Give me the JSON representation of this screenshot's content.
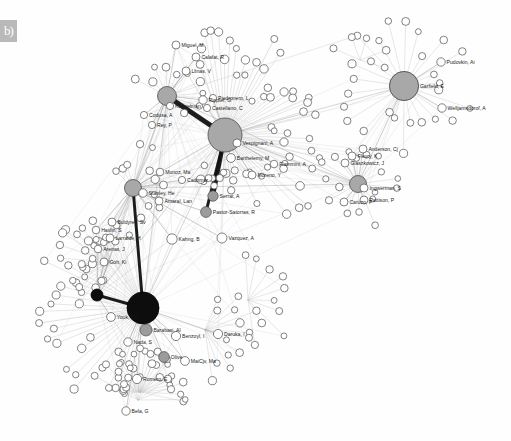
{
  "figure": {
    "panel_tag": "b)",
    "background_color": "#fefefe",
    "width": 511,
    "height": 441,
    "title": ""
  },
  "style": {
    "hub_black": "#0d0d0d",
    "hub_gray": "#a8a8a8",
    "node_mid_gray": "#9b9b9b",
    "node_white": "#ffffff",
    "node_stroke": "#4d4d4d",
    "edge_light": "#bfbfbf",
    "edge_mid": "#8a8a8a",
    "edge_dark": "#111111",
    "label_color": "#1a1a1a"
  },
  "chart_data": {
    "type": "scatter",
    "title": "",
    "xlabel": "",
    "ylabel": "",
    "layout": "force-directed network, no axes, no grid, no legend",
    "clusters": [
      {
        "name": "network-science-cluster",
        "hub": "Barabasi, AL",
        "position": "left-center"
      },
      {
        "name": "webometrics-cluster",
        "hub": "unlabeled-gray-hub",
        "position": "top-center"
      },
      {
        "name": "garfield-cluster",
        "hub": "Garfield, E",
        "position": "top-right"
      },
      {
        "name": "informetrics-cluster",
        "hub": "unlabeled-gray-hub-2",
        "position": "right-center"
      }
    ],
    "labeled_nodes": [
      {
        "label": "Miguel, M",
        "x": 176,
        "y": 45,
        "r": 4.0,
        "fill": "#ffffff"
      },
      {
        "label": "Calafat, R",
        "x": 196,
        "y": 57,
        "r": 4.0,
        "fill": "#ffffff"
      },
      {
        "label": "Llinas, V",
        "x": 186,
        "y": 71,
        "r": 4.0,
        "fill": "#ffffff"
      },
      {
        "label": "Kappelman",
        "x": 170,
        "y": 106,
        "r": 3.6,
        "fill": "#ffffff"
      },
      {
        "label": "Codusa, A",
        "x": 144,
        "y": 115,
        "r": 3.6,
        "fill": "#ffffff"
      },
      {
        "label": "Rey, P",
        "x": 152,
        "y": 125,
        "r": 3.6,
        "fill": "#ffffff"
      },
      {
        "label": "Rippler, G",
        "x": 203,
        "y": 100,
        "r": 4.2,
        "fill": "#ffffff"
      },
      {
        "label": "Piedronero, L",
        "x": 213,
        "y": 98,
        "r": 3.6,
        "fill": "#ffffff"
      },
      {
        "label": "Castellano, C",
        "x": 207,
        "y": 108,
        "r": 3.6,
        "fill": "#ffffff"
      },
      {
        "label": "Vespignani, A",
        "x": 237,
        "y": 143,
        "r": 4.0,
        "fill": "#ffffff"
      },
      {
        "label": "Barthelemy, M",
        "x": 231,
        "y": 158,
        "r": 4.4,
        "fill": "#ffffff"
      },
      {
        "label": "Flammini, A",
        "x": 274,
        "y": 164,
        "r": 3.8,
        "fill": "#ffffff"
      },
      {
        "label": "Moreno, Y",
        "x": 252,
        "y": 175,
        "r": 4.0,
        "fill": "#ffffff"
      },
      {
        "label": "Serrat, A",
        "x": 213,
        "y": 196,
        "r": 5.2,
        "fill": "#9b9b9b"
      },
      {
        "label": "Pastor-Satorras, R",
        "x": 206,
        "y": 212,
        "r": 5.4,
        "fill": "#9b9b9b"
      },
      {
        "label": "Vazquez, A",
        "x": 222,
        "y": 238,
        "r": 5.0,
        "fill": "#ffffff"
      },
      {
        "label": "Cadomar",
        "x": 182,
        "y": 180,
        "r": 3.6,
        "fill": "#ffffff"
      },
      {
        "label": "Munoz, Ma",
        "x": 160,
        "y": 172,
        "r": 3.8,
        "fill": "#ffffff"
      },
      {
        "label": "Stanley, He",
        "x": 143,
        "y": 193,
        "r": 4.2,
        "fill": "#ffffff"
      },
      {
        "label": "Amaral, Lan",
        "x": 159,
        "y": 201,
        "r": 4.0,
        "fill": "#ffffff"
      },
      {
        "label": "Buldyrev, Sv",
        "x": 112,
        "y": 222,
        "r": 4.0,
        "fill": "#ffffff"
      },
      {
        "label": "Havlin, S",
        "x": 96,
        "y": 230,
        "r": 3.8,
        "fill": "#ffffff"
      },
      {
        "label": "Larralde, H",
        "x": 110,
        "y": 238,
        "r": 4.0,
        "fill": "#ffffff"
      },
      {
        "label": "Arenas, J",
        "x": 98,
        "y": 249,
        "r": 3.8,
        "fill": "#ffffff"
      },
      {
        "label": "Kahng, B",
        "x": 172,
        "y": 239,
        "r": 5.2,
        "fill": "#ffffff"
      },
      {
        "label": "Goh, Ki",
        "x": 104,
        "y": 262,
        "r": 4.0,
        "fill": "#ffffff"
      },
      {
        "label": "Youk, Tw",
        "x": 111,
        "y": 317,
        "r": 4.4,
        "fill": "#ffffff"
      },
      {
        "label": "Barabasi, Al",
        "x": 146,
        "y": 330,
        "r": 6.0,
        "fill": "#9b9b9b"
      },
      {
        "label": "Benzoyl, I",
        "x": 176,
        "y": 336,
        "r": 4.6,
        "fill": "#ffffff"
      },
      {
        "label": "Daruka, I",
        "x": 218,
        "y": 334,
        "r": 4.6,
        "fill": "#ffffff"
      },
      {
        "label": "Nada, S",
        "x": 128,
        "y": 342,
        "r": 4.2,
        "fill": "#ffffff"
      },
      {
        "label": "Olive",
        "x": 164,
        "y": 357,
        "r": 5.4,
        "fill": "#9b9b9b"
      },
      {
        "label": "MaiCjv, Ma",
        "x": 185,
        "y": 361,
        "r": 4.4,
        "fill": "#ffffff"
      },
      {
        "label": "Romero, E",
        "x": 137,
        "y": 379,
        "r": 4.6,
        "fill": "#ffffff"
      },
      {
        "label": "Bela, G",
        "x": 126,
        "y": 411,
        "r": 4.2,
        "fill": "#ffffff"
      },
      {
        "label": "Pudovkin, Ai",
        "x": 441,
        "y": 62,
        "r": 4.2,
        "fill": "#ffffff"
      },
      {
        "label": "Garfield, E",
        "x": 404,
        "y": 86,
        "r": 14.5,
        "fill": "#a8a8a8"
      },
      {
        "label": "Welljamsdorof, A",
        "x": 442,
        "y": 108,
        "r": 4.2,
        "fill": "#ffffff"
      },
      {
        "label": "Anderson, Cj",
        "x": 363,
        "y": 149,
        "r": 4.0,
        "fill": "#ffffff"
      },
      {
        "label": "Fleury, K",
        "x": 352,
        "y": 156,
        "r": 4.0,
        "fill": "#ffffff"
      },
      {
        "label": "Glaszkowicz, J",
        "x": 345,
        "y": 163,
        "r": 4.0,
        "fill": "#ffffff"
      },
      {
        "label": "Ingwerman, S",
        "x": 364,
        "y": 188,
        "r": 4.0,
        "fill": "#ffffff"
      },
      {
        "label": "Pattison, P",
        "x": 364,
        "y": 200,
        "r": 4.0,
        "fill": "#ffffff"
      },
      {
        "label": "Caruzo, P",
        "x": 344,
        "y": 202,
        "r": 4.0,
        "fill": "#ffffff"
      }
    ],
    "hubs": [
      {
        "name": "gray-hub-top",
        "x": 225,
        "y": 135,
        "r": 17.0,
        "fill": "#a8a8a8"
      },
      {
        "name": "gray-hub-upper",
        "x": 167,
        "y": 96,
        "r": 9.5,
        "fill": "#a8a8a8"
      },
      {
        "name": "gray-hub-mid",
        "x": 133,
        "y": 188,
        "r": 8.5,
        "fill": "#a8a8a8"
      },
      {
        "name": "black-hub-small",
        "x": 97,
        "y": 295,
        "r": 6.0,
        "fill": "#0d0d0d"
      },
      {
        "name": "black-hub-main",
        "x": 143,
        "y": 308,
        "r": 16.0,
        "fill": "#0d0d0d"
      },
      {
        "name": "garfield-hub",
        "x": 404,
        "y": 86,
        "r": 14.5,
        "fill": "#a8a8a8"
      },
      {
        "name": "informetrics-hub",
        "x": 358,
        "y": 184,
        "r": 8.5,
        "fill": "#a8a8a8"
      }
    ],
    "unlabeled_node_count": 168,
    "strong_edges": [
      {
        "from": "gray-hub-upper",
        "to": "gray-hub-top",
        "weight": 5
      },
      {
        "from": "gray-hub-top",
        "to": "Serrat, A",
        "weight": 4
      },
      {
        "from": "gray-hub-top",
        "to": "Pastor-Satorras, R",
        "weight": 3
      },
      {
        "from": "black-hub-main",
        "to": "gray-hub-mid",
        "weight": 3
      },
      {
        "from": "black-hub-main",
        "to": "black-hub-small",
        "weight": 3
      },
      {
        "from": "black-hub-main",
        "to": "Barabasi, Al",
        "weight": 3
      }
    ]
  }
}
